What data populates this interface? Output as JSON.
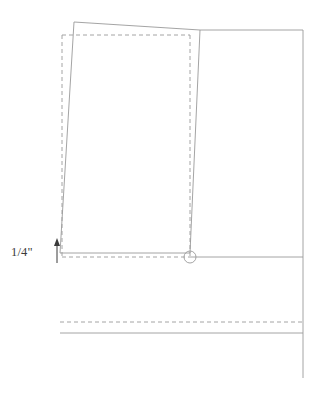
{
  "figure": {
    "title": "",
    "background_color": "#ffffff",
    "line_color": "#9a9a9a",
    "dashed_color": "#9a9a9a",
    "text_color": "#3a3a3a",
    "canvas": {
      "width": 312,
      "height": 393
    }
  },
  "annotations": {
    "offset_dimension": {
      "label": "1/4\"",
      "arrow": "up-arrow",
      "arrow_x": 57,
      "arrow_top_y": 240,
      "arrow_bottom_y": 263
    }
  },
  "geometry": {
    "reference_rectangle": {
      "name": "dashed-reference-rectangle",
      "style": "dashed",
      "left": 62,
      "top": 35,
      "right": 190,
      "bottom": 257
    },
    "tilted_panel": {
      "name": "tilted-panel-outline",
      "style": "solid",
      "points": [
        [
          74,
          22
        ],
        [
          200,
          30
        ],
        [
          190,
          253
        ],
        [
          60,
          253
        ]
      ]
    },
    "right_panel": {
      "name": "right-panel-outline",
      "style": "solid",
      "top_y": 30,
      "bottom_y": 378,
      "left_x": 200,
      "right_x": 303
    },
    "baseline": {
      "name": "horizontal-baseline",
      "style": "solid",
      "y": 257,
      "x_start": 190,
      "x_end": 303
    },
    "lower_dashed_line": {
      "name": "lower-dashed-guide",
      "style": "dashed",
      "y": 322,
      "x_start": 60,
      "x_end": 303
    },
    "lower_solid_line": {
      "name": "lower-solid-edge",
      "style": "solid",
      "y": 333,
      "x_start": 60,
      "x_end": 303
    },
    "pivot_circle": {
      "name": "pivot-circle",
      "center_x": 190,
      "center_y": 257,
      "radius": 6
    }
  }
}
